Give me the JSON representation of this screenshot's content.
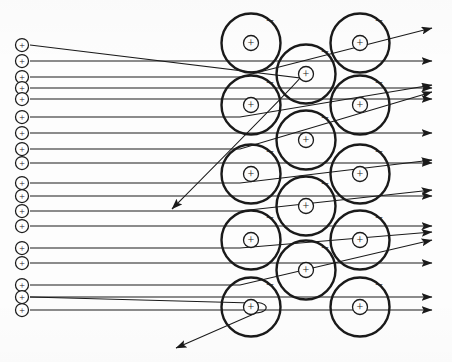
{
  "figure": {
    "type": "physics-diagram",
    "width": 452,
    "height": 362,
    "background_color": "#fdfdfd",
    "stroke_color": "#1a1a1a"
  },
  "symbols": {
    "positive_charge": "+",
    "negative_charge": "–",
    "nucleus_label": "+",
    "electron_label": "–"
  },
  "incoming_beam": {
    "name": "incident-positive-particles",
    "count": 18,
    "particle_symbol": "+",
    "particle_radius": 6.5,
    "particle_x": 22,
    "ray_start_x": 30,
    "ys": [
      45,
      61,
      77,
      88,
      99,
      117,
      133,
      149,
      163,
      183,
      196,
      211,
      226,
      248,
      263,
      285,
      297,
      310
    ]
  },
  "lattice": {
    "name": "atom-lattice",
    "atom_radius": 29.5,
    "nucleus_radius": 7.5,
    "columns": [
      {
        "cx": 251,
        "cys": [
          43,
          105,
          174,
          240,
          307
        ]
      },
      {
        "cx": 306,
        "cys": [
          74,
          140,
          206,
          270
        ]
      },
      {
        "cx": 360,
        "cys": [
          43,
          105,
          174,
          240,
          307
        ]
      }
    ],
    "electron_offset": {
      "dx": 19,
      "dy": -20
    }
  },
  "rays": {
    "undeflected_ys": [
      61,
      88,
      99,
      133,
      163,
      196,
      226,
      263,
      297,
      310
    ],
    "outgoing_x": 432,
    "deflected": [
      {
        "name": "ray-deflected-up-1",
        "start_y": 77,
        "end_y": 28,
        "label": "small-angle up"
      },
      {
        "name": "ray-deflected-up-2",
        "start_y": 117,
        "end_y": 85,
        "label": "small-angle up"
      },
      {
        "name": "ray-deflected-up-3",
        "start_y": 149,
        "end_y": 92,
        "label": "small-angle up"
      },
      {
        "name": "ray-deflected-up-4",
        "start_y": 183,
        "end_y": 160,
        "label": "small-angle up"
      },
      {
        "name": "ray-deflected-up-5",
        "start_y": 211,
        "end_y": 190,
        "label": "small-angle up"
      },
      {
        "name": "ray-deflected-up-6",
        "start_y": 248,
        "end_y": 232,
        "label": "small-angle up"
      },
      {
        "name": "ray-deflected-up-7",
        "start_y": 285,
        "end_y": 240,
        "label": "small-angle up"
      },
      {
        "name": "ray-backscattered",
        "start_y": 45,
        "end_x": 172,
        "end_y": 209,
        "label": "large-angle back-scatter"
      },
      {
        "name": "ray-bottom-scatter",
        "start_y": 297,
        "end_x": 176,
        "end_y": 348,
        "label": "large-angle scatter around nucleus"
      }
    ]
  },
  "annotations": {
    "beam_label": "",
    "target_label": "",
    "caption": ""
  }
}
